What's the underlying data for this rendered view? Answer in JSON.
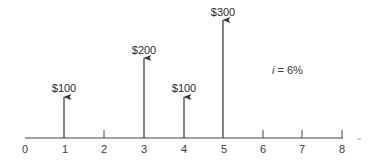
{
  "diagram": {
    "type": "cash-flow-diagram",
    "interest_rate_label": "= 6%",
    "interest_rate_symbol": "i",
    "axis": {
      "ticks": [
        "0",
        "1",
        "2",
        "3",
        "4",
        "5",
        "6",
        "7",
        "8"
      ]
    },
    "cash_flows": [
      {
        "period": 1,
        "label": "$100",
        "amount": 100,
        "direction": "up"
      },
      {
        "period": 3,
        "label": "$200",
        "amount": 200,
        "direction": "up"
      },
      {
        "period": 4,
        "label": "$100",
        "amount": 100,
        "direction": "up"
      },
      {
        "period": 5,
        "label": "$300",
        "amount": 300,
        "direction": "up"
      }
    ]
  }
}
